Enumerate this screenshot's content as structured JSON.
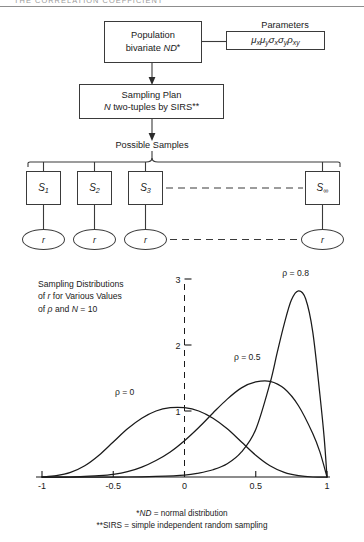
{
  "running_head": {
    "text": "THE CORRELATION COEFFICIENT"
  },
  "diagram": {
    "population_box": {
      "line1": "Population",
      "line2_prefix": "bivariate ",
      "line2_italic": "ND",
      "line2_star": "*"
    },
    "parameters_label": "Parameters",
    "parameters_box": {
      "mu_x": "μ",
      "mu_x_sub": "x",
      "mu_y": "μ",
      "mu_y_sub": "y",
      "sigma_x": "σ",
      "sigma_x_sub": "x",
      "sigma_y": "σ",
      "sigma_y_sub": "y",
      "rho_xy": "ρ",
      "rho_xy_sub": "xy"
    },
    "sampling_plan_box": {
      "line1": "Sampling Plan",
      "line2_italic_n": "N",
      "line2_rest": " two-tuples by SIRS",
      "line2_stars": "**"
    },
    "possible_samples_label": "Possible Samples",
    "sample_boxes": [
      {
        "symbol": "S",
        "subscript": "1"
      },
      {
        "symbol": "S",
        "subscript": "2"
      },
      {
        "symbol": "S",
        "subscript": "3"
      },
      {
        "symbol": "S",
        "subscript": "∞"
      }
    ],
    "statistic_pills": [
      {
        "label": "r"
      },
      {
        "label": "r"
      },
      {
        "label": "r"
      },
      {
        "label": "r"
      }
    ]
  },
  "chart_caption": {
    "line1": "Sampling Distributions",
    "line2_a": "of ",
    "line2_italic": "r",
    "line2_b": " for Various Values",
    "line3_a": "of ",
    "line3_rho": "ρ",
    "line3_b": " and ",
    "line3_italic_n": "N",
    "line3_c": " = 10"
  },
  "footnotes": [
    {
      "marks": "*",
      "term": "ND",
      "sep": " = ",
      "definition": "normal distribution"
    },
    {
      "marks": "**",
      "term": "SIRS",
      "sep": " = ",
      "definition": "simple independent random sampling"
    }
  ],
  "chart_data": {
    "type": "line",
    "title": "Sampling Distributions of r for Various Values of ρ and N = 10",
    "xlabel": "r",
    "ylabel": "",
    "xlim": [
      -1,
      1
    ],
    "ylim": [
      0,
      3
    ],
    "x_ticks": [
      "-1",
      "-0.5",
      "0",
      "0.5",
      "1"
    ],
    "x_tick_values": [
      -1,
      -0.5,
      0,
      0.5,
      1
    ],
    "y_ticks": [
      "1",
      "2",
      "3"
    ],
    "y_tick_values": [
      1,
      2,
      3
    ],
    "grid": false,
    "legend_position": "inline-annotations",
    "series": [
      {
        "name": "ρ = 0",
        "label": "ρ = 0",
        "label_x": -0.42,
        "label_y": 1.25,
        "peak_x": 0.0,
        "peak_y": 1.05,
        "x": [
          -1.0,
          -0.9,
          -0.8,
          -0.7,
          -0.6,
          -0.5,
          -0.4,
          -0.3,
          -0.2,
          -0.1,
          0.0,
          0.1,
          0.2,
          0.3,
          0.4,
          0.5,
          0.6,
          0.7,
          0.8,
          0.9,
          1.0
        ],
        "y": [
          0.0,
          0.02,
          0.07,
          0.17,
          0.33,
          0.53,
          0.73,
          0.89,
          1.0,
          1.05,
          1.05,
          1.0,
          0.89,
          0.73,
          0.53,
          0.33,
          0.17,
          0.07,
          0.02,
          0.0,
          0.0
        ]
      },
      {
        "name": "ρ = 0.5",
        "label": "ρ = 0.5",
        "label_x": 0.44,
        "label_y": 1.78,
        "peak_x": 0.6,
        "peak_y": 1.45,
        "x": [
          -1.0,
          -0.9,
          -0.8,
          -0.7,
          -0.6,
          -0.5,
          -0.4,
          -0.3,
          -0.2,
          -0.1,
          0.0,
          0.1,
          0.2,
          0.3,
          0.4,
          0.5,
          0.6,
          0.7,
          0.8,
          0.9,
          0.95,
          1.0
        ],
        "y": [
          0.0,
          0.0,
          0.0,
          0.01,
          0.02,
          0.04,
          0.08,
          0.15,
          0.25,
          0.38,
          0.55,
          0.75,
          0.97,
          1.18,
          1.35,
          1.44,
          1.45,
          1.34,
          1.08,
          0.66,
          0.38,
          0.0
        ]
      },
      {
        "name": "ρ = 0.8",
        "label": "ρ = 0.8",
        "label_x": 0.78,
        "label_y": 3.05,
        "peak_x": 0.81,
        "peak_y": 2.82,
        "x": [
          -1.0,
          -0.8,
          -0.6,
          -0.4,
          -0.2,
          0.0,
          0.1,
          0.2,
          0.3,
          0.4,
          0.5,
          0.6,
          0.65,
          0.7,
          0.75,
          0.8,
          0.85,
          0.9,
          0.95,
          0.98,
          1.0
        ],
        "y": [
          0.0,
          0.0,
          0.0,
          0.0,
          0.01,
          0.03,
          0.06,
          0.11,
          0.2,
          0.38,
          0.72,
          1.42,
          1.88,
          2.32,
          2.68,
          2.82,
          2.7,
          2.2,
          1.25,
          0.6,
          0.0
        ]
      }
    ]
  }
}
